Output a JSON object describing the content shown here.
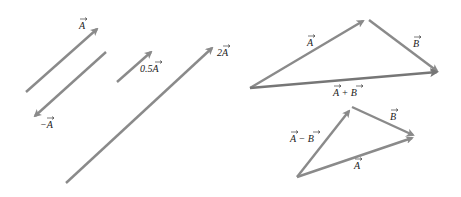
{
  "diagram": {
    "colors": {
      "vector": "#8a8a8a",
      "vector_dark": "#767676",
      "label": "#222222"
    },
    "left_panel": {
      "vectors": [
        {
          "name": "A",
          "label": "A"
        },
        {
          "name": "negative-A",
          "label": "−A"
        },
        {
          "name": "half-A",
          "label": "0.5A"
        },
        {
          "name": "double-A",
          "label": "2A"
        }
      ]
    },
    "sum_triangle": {
      "labels": {
        "a": "A",
        "b": "B",
        "sum": "A + B"
      }
    },
    "difference_triangle": {
      "labels": {
        "diff": "A − B",
        "b": "B",
        "a": "A"
      }
    }
  }
}
